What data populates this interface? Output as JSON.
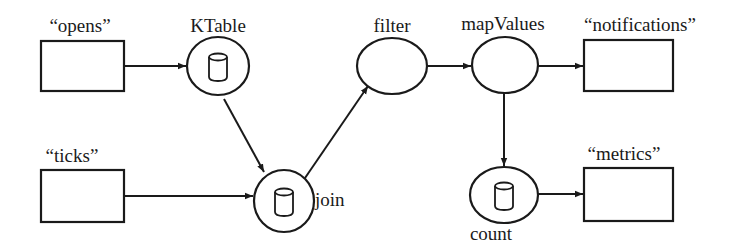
{
  "diagram": {
    "colors": {
      "stroke": "#1a1a1a",
      "background": "#ffffff",
      "fill": "#ffffff"
    },
    "nodes": {
      "opens": {
        "label": "“opens”",
        "type": "topic",
        "icon": "none"
      },
      "ticks": {
        "label": "“ticks”",
        "type": "topic",
        "icon": "none"
      },
      "ktable": {
        "label": "KTable",
        "type": "processor",
        "icon": "database-icon"
      },
      "join": {
        "label": "join",
        "type": "processor",
        "icon": "database-icon"
      },
      "filter": {
        "label": "filter",
        "type": "processor",
        "icon": "none"
      },
      "mapvalues": {
        "label": "mapValues",
        "type": "processor",
        "icon": "none"
      },
      "count": {
        "label": "count",
        "type": "processor",
        "icon": "database-icon"
      },
      "notifications": {
        "label": "“notifications”",
        "type": "topic",
        "icon": "none"
      },
      "metrics": {
        "label": "“metrics”",
        "type": "topic",
        "icon": "none"
      }
    },
    "edges": [
      {
        "from": "opens",
        "to": "ktable"
      },
      {
        "from": "ktable",
        "to": "join"
      },
      {
        "from": "ticks",
        "to": "join"
      },
      {
        "from": "join",
        "to": "filter"
      },
      {
        "from": "filter",
        "to": "mapvalues"
      },
      {
        "from": "mapvalues",
        "to": "notifications"
      },
      {
        "from": "mapvalues",
        "to": "count"
      },
      {
        "from": "count",
        "to": "metrics"
      }
    ]
  }
}
